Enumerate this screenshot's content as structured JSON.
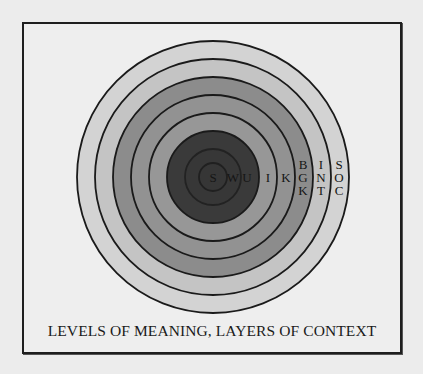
{
  "figure": {
    "caption": "LEVELS OF MEANING, LAYERS OF CONTEXT",
    "center": {
      "x": 213,
      "y": 177
    },
    "rings": [
      {
        "r": 136,
        "fill": "#d3d3d3"
      },
      {
        "r": 118,
        "fill": "#c4c4c4"
      },
      {
        "r": 100,
        "fill": "#8c8c8c"
      },
      {
        "r": 82,
        "fill": "#929292"
      },
      {
        "r": 64,
        "fill": "#979797"
      },
      {
        "r": 46,
        "fill": "#3a3a3a"
      },
      {
        "r": 28,
        "fill": "#373737"
      },
      {
        "r": 14,
        "fill": "#363636"
      }
    ],
    "labels": {
      "s": "S",
      "w": "W",
      "u": "U",
      "i": "I",
      "k": "K",
      "bgk": [
        "B",
        "G",
        "K"
      ],
      "int": [
        "I",
        "N",
        "T"
      ],
      "soc": [
        "S",
        "O",
        "C"
      ]
    },
    "colors": {
      "background": "#ececec",
      "stroke": "#1a1a1a",
      "text": "#151515"
    }
  }
}
